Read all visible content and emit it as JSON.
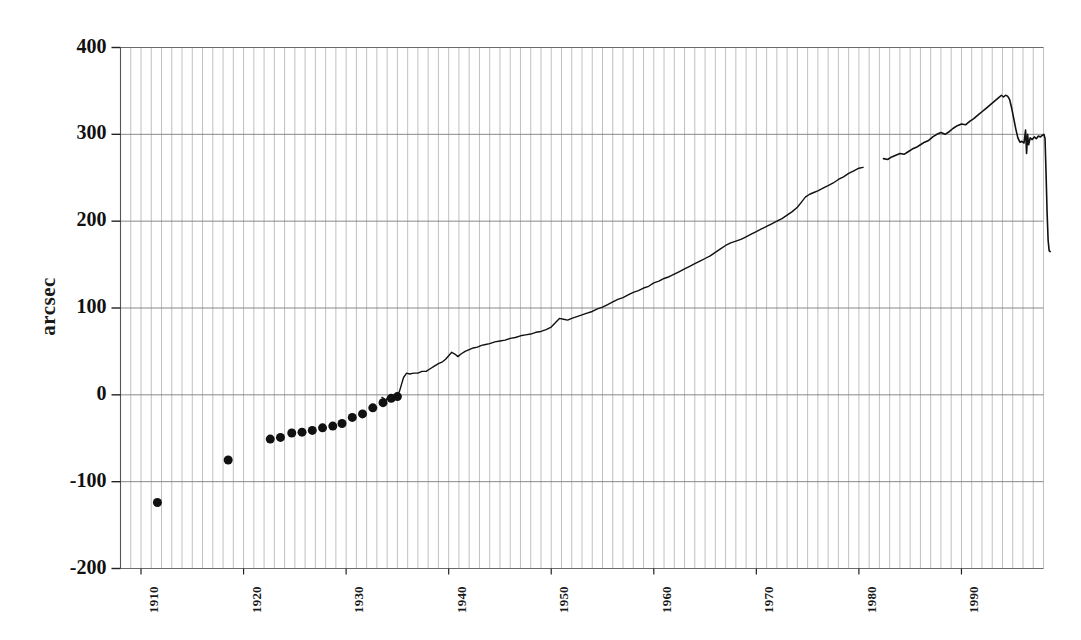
{
  "chart_data": {
    "type": "line",
    "title": "",
    "subtitle": "",
    "xlabel": "",
    "ylabel": "arcsec",
    "xlim": [
      1908,
      1998
    ],
    "ylim": [
      -200,
      400
    ],
    "yticks": [
      400,
      300,
      200,
      100,
      0,
      -100,
      -200
    ],
    "ytick_labels": [
      "400",
      "300",
      "200",
      "100",
      "0",
      "-100",
      "-200"
    ],
    "xticks": [
      1910,
      1920,
      1930,
      1940,
      1950,
      1960,
      1970,
      1980,
      1990
    ],
    "xtick_labels": [
      "1910",
      "1920",
      "1930",
      "1940",
      "1950",
      "1960",
      "1970",
      "1980",
      "1990"
    ],
    "grid": {
      "vertical": true,
      "vertical_interval_years": 1,
      "horizontal": true,
      "horizontal_interval": 100,
      "color": "#b9b9b9"
    },
    "legend": null,
    "annotations": [],
    "series": [
      {
        "name": "early annual determinations",
        "style": "scatter",
        "marker": "filled-circle",
        "marker_size": 9,
        "color": "#111111",
        "points": [
          [
            1911.6,
            -124
          ],
          [
            1918.5,
            -75
          ],
          [
            1922.6,
            -51
          ],
          [
            1923.6,
            -49
          ],
          [
            1924.7,
            -44
          ],
          [
            1925.7,
            -43
          ],
          [
            1926.7,
            -41
          ],
          [
            1927.7,
            -38
          ],
          [
            1928.7,
            -36
          ],
          [
            1929.6,
            -33
          ],
          [
            1930.6,
            -26
          ],
          [
            1931.6,
            -22
          ],
          [
            1932.6,
            -15
          ],
          [
            1933.6,
            -9
          ],
          [
            1934.4,
            -4
          ],
          [
            1935.0,
            -2
          ]
        ]
      },
      {
        "name": "continuous record (segment 1)",
        "style": "line",
        "color": "#111111",
        "linewidth": 1.4,
        "points": [
          [
            1933.5,
            -3
          ],
          [
            1933.9,
            -6
          ],
          [
            1934.1,
            -2
          ],
          [
            1934.4,
            -5
          ],
          [
            1934.7,
            -1
          ],
          [
            1935.0,
            0
          ],
          [
            1935.2,
            4
          ],
          [
            1935.4,
            12
          ],
          [
            1935.6,
            20
          ],
          [
            1935.9,
            25
          ],
          [
            1936.2,
            24
          ],
          [
            1936.6,
            25
          ],
          [
            1937.0,
            25
          ],
          [
            1937.4,
            27
          ],
          [
            1937.8,
            27
          ],
          [
            1938.2,
            30
          ],
          [
            1938.6,
            33
          ],
          [
            1939.0,
            36
          ],
          [
            1939.4,
            38
          ],
          [
            1939.7,
            41
          ],
          [
            1940.0,
            45
          ],
          [
            1940.3,
            49
          ],
          [
            1940.6,
            47
          ],
          [
            1940.9,
            44
          ],
          [
            1941.2,
            47
          ],
          [
            1941.6,
            50
          ],
          [
            1942.0,
            52
          ],
          [
            1942.4,
            54
          ],
          [
            1942.8,
            55
          ],
          [
            1943.2,
            57
          ],
          [
            1943.6,
            58
          ],
          [
            1944.0,
            59
          ],
          [
            1944.5,
            61
          ],
          [
            1945.0,
            62
          ],
          [
            1945.5,
            63
          ],
          [
            1946.0,
            65
          ],
          [
            1946.5,
            66
          ],
          [
            1947.0,
            68
          ],
          [
            1947.5,
            69
          ],
          [
            1948.0,
            70
          ],
          [
            1948.5,
            72
          ],
          [
            1949.0,
            73
          ],
          [
            1949.5,
            75
          ],
          [
            1950.0,
            78
          ],
          [
            1950.4,
            83
          ],
          [
            1950.8,
            88
          ],
          [
            1951.2,
            87
          ],
          [
            1951.6,
            86
          ],
          [
            1952.0,
            88
          ],
          [
            1952.5,
            90
          ],
          [
            1953.0,
            92
          ],
          [
            1953.5,
            94
          ],
          [
            1954.0,
            96
          ],
          [
            1954.5,
            99
          ],
          [
            1955.0,
            101
          ],
          [
            1955.5,
            104
          ],
          [
            1956.0,
            107
          ],
          [
            1956.5,
            110
          ],
          [
            1957.0,
            112
          ],
          [
            1957.5,
            115
          ],
          [
            1958.0,
            118
          ],
          [
            1958.5,
            120
          ],
          [
            1959.0,
            123
          ],
          [
            1959.5,
            125
          ],
          [
            1960.0,
            129
          ],
          [
            1960.5,
            131
          ],
          [
            1961.0,
            134
          ],
          [
            1961.5,
            136
          ],
          [
            1962.0,
            139
          ],
          [
            1962.5,
            142
          ],
          [
            1963.0,
            145
          ],
          [
            1963.5,
            148
          ],
          [
            1964.0,
            151
          ],
          [
            1964.5,
            154
          ],
          [
            1965.0,
            157
          ],
          [
            1965.5,
            160
          ],
          [
            1966.0,
            164
          ],
          [
            1966.5,
            168
          ],
          [
            1967.0,
            172
          ],
          [
            1967.5,
            175
          ],
          [
            1968.0,
            177
          ],
          [
            1968.5,
            179
          ],
          [
            1969.0,
            182
          ],
          [
            1969.5,
            185
          ],
          [
            1970.0,
            188
          ],
          [
            1970.5,
            191
          ],
          [
            1971.0,
            194
          ],
          [
            1971.5,
            197
          ],
          [
            1972.0,
            200
          ],
          [
            1972.5,
            203
          ],
          [
            1973.0,
            207
          ],
          [
            1973.5,
            211
          ],
          [
            1974.0,
            216
          ],
          [
            1974.4,
            222
          ],
          [
            1974.8,
            228
          ],
          [
            1975.2,
            231
          ],
          [
            1975.6,
            233
          ],
          [
            1976.0,
            235
          ],
          [
            1976.5,
            238
          ],
          [
            1977.0,
            241
          ],
          [
            1977.5,
            244
          ],
          [
            1978.0,
            248
          ],
          [
            1978.5,
            251
          ],
          [
            1979.0,
            255
          ],
          [
            1979.5,
            258
          ],
          [
            1980.0,
            261
          ],
          [
            1980.4,
            262
          ]
        ]
      },
      {
        "name": "continuous record (segment 2)",
        "style": "line",
        "color": "#111111",
        "linewidth": 1.6,
        "points": [
          [
            1982.4,
            272
          ],
          [
            1982.8,
            271
          ],
          [
            1983.2,
            274
          ],
          [
            1983.6,
            276
          ],
          [
            1984.0,
            278
          ],
          [
            1984.4,
            277
          ],
          [
            1984.8,
            280
          ],
          [
            1985.2,
            283
          ],
          [
            1985.6,
            285
          ],
          [
            1986.0,
            288
          ],
          [
            1986.4,
            291
          ],
          [
            1986.8,
            293
          ],
          [
            1987.2,
            297
          ],
          [
            1987.6,
            300
          ],
          [
            1988.0,
            302
          ],
          [
            1988.4,
            300
          ],
          [
            1988.8,
            303
          ],
          [
            1989.2,
            307
          ],
          [
            1989.6,
            310
          ],
          [
            1990.0,
            312
          ],
          [
            1990.4,
            311
          ],
          [
            1990.8,
            315
          ],
          [
            1991.2,
            318
          ],
          [
            1991.6,
            322
          ],
          [
            1992.0,
            326
          ],
          [
            1992.4,
            330
          ],
          [
            1992.8,
            334
          ],
          [
            1993.2,
            338
          ],
          [
            1993.6,
            342
          ],
          [
            1993.9,
            345
          ],
          [
            1994.1,
            343
          ],
          [
            1994.3,
            345
          ],
          [
            1994.5,
            344
          ],
          [
            1994.7,
            340
          ],
          [
            1994.9,
            330
          ],
          [
            1995.1,
            318
          ],
          [
            1995.3,
            306
          ],
          [
            1995.5,
            296
          ],
          [
            1995.7,
            291
          ],
          [
            1995.9,
            292
          ],
          [
            1996.1,
            290
          ],
          [
            1996.25,
            305
          ],
          [
            1996.35,
            278
          ],
          [
            1996.45,
            300
          ],
          [
            1996.55,
            288
          ],
          [
            1996.7,
            296
          ],
          [
            1996.9,
            294
          ],
          [
            1997.1,
            297
          ],
          [
            1997.3,
            295
          ],
          [
            1997.5,
            298
          ],
          [
            1997.7,
            297
          ],
          [
            1997.9,
            299
          ],
          [
            1998.05,
            300
          ],
          [
            1998.15,
            295
          ],
          [
            1998.25,
            255
          ],
          [
            1998.35,
            210
          ],
          [
            1998.45,
            178
          ],
          [
            1998.55,
            166
          ],
          [
            1998.65,
            165
          ]
        ]
      }
    ]
  }
}
